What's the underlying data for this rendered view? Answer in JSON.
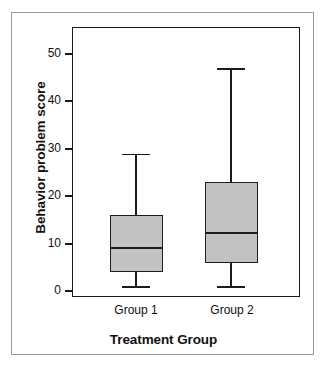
{
  "chart_data": {
    "type": "box",
    "title": "",
    "xlabel": "Treatment Group",
    "ylabel": "Behavior problem score",
    "categories": [
      "Group 1",
      "Group 2"
    ],
    "ylim": [
      0,
      56
    ],
    "yticks": [
      0,
      10,
      20,
      30,
      40,
      50
    ],
    "ytick_labels": [
      "0",
      "10",
      "20",
      "30",
      "40",
      "50"
    ],
    "grid": false,
    "legend": "none",
    "box_fill_color": "#c2c2c2",
    "box_line_color": "#1c1c1c",
    "frame_color": "#1a1a1a",
    "background_color": "#ffffff",
    "boxes": [
      {
        "label": "Group 1",
        "whisker_low": 1,
        "q1": 4,
        "median": 9,
        "q3": 16,
        "whisker_high": 29
      },
      {
        "label": "Group 2",
        "whisker_low": 1,
        "q1": 6,
        "median": 12.3,
        "q3": 23,
        "whisker_high": 47
      }
    ]
  },
  "axes": {
    "y_label": "Behavior problem score",
    "x_label": "Treatment Group",
    "y_ticks": [
      "50",
      "40",
      "30",
      "20",
      "10",
      "0"
    ],
    "x_ticks": [
      "Group 1",
      "Group 2"
    ]
  }
}
